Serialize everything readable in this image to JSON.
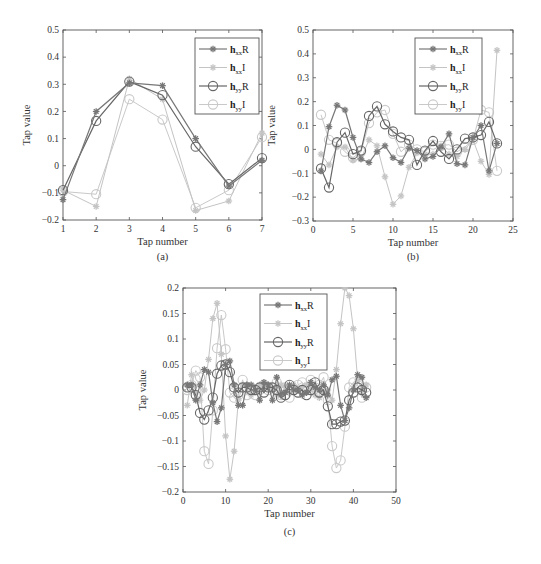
{
  "chart_data": [
    {
      "id": "a",
      "type": "line",
      "caption": "(a)",
      "xlabel": "Tap number",
      "ylabel": "Tap value",
      "xlim": [
        1,
        7
      ],
      "ylim": [
        -0.2,
        0.5
      ],
      "xticks": [
        1,
        2,
        3,
        4,
        5,
        6,
        7
      ],
      "yticks": [
        -0.2,
        -0.1,
        0,
        0.1,
        0.2,
        0.3,
        0.4,
        0.5
      ],
      "ytick_labels": [
        "−0.2",
        "−0.1",
        "0",
        "0.1",
        "0.2",
        "0.3",
        "0.4",
        "0.5"
      ],
      "grid": false,
      "legend_position": "top-right",
      "x": [
        1,
        2,
        3,
        4,
        5,
        6,
        7
      ],
      "series": [
        {
          "name": "hxxR",
          "values": [
            -0.125,
            0.2,
            0.305,
            0.295,
            0.1,
            -0.075,
            0.02
          ]
        },
        {
          "name": "hxxI",
          "values": [
            -0.09,
            -0.15,
            0.32,
            0.245,
            -0.165,
            -0.13,
            0.12
          ]
        },
        {
          "name": "hyyR",
          "values": [
            -0.09,
            0.165,
            0.31,
            0.26,
            0.07,
            -0.068,
            0.028
          ]
        },
        {
          "name": "hyyI",
          "values": [
            -0.095,
            -0.105,
            0.245,
            0.17,
            -0.155,
            -0.09,
            0.105
          ]
        }
      ]
    },
    {
      "id": "b",
      "type": "line",
      "caption": "(b)",
      "xlabel": "Tap number",
      "ylabel": "Tap value",
      "xlim": [
        0,
        25
      ],
      "ylim": [
        -0.3,
        0.5
      ],
      "xticks": [
        0,
        5,
        10,
        15,
        20,
        25
      ],
      "yticks": [
        -0.3,
        -0.2,
        -0.1,
        0,
        0.1,
        0.2,
        0.3,
        0.4,
        0.5
      ],
      "ytick_labels": [
        "−0.3",
        "−0.2",
        "−0.1",
        "0",
        "0.1",
        "0.2",
        "0.3",
        "0.4",
        "0.5"
      ],
      "grid": false,
      "legend_position": "top-right",
      "x": [
        1,
        2,
        3,
        4,
        5,
        6,
        7,
        8,
        9,
        10,
        11,
        12,
        13,
        14,
        15,
        16,
        17,
        18,
        19,
        20,
        21,
        22,
        23
      ],
      "series": [
        {
          "name": "hxxR",
          "values": [
            -0.09,
            0.095,
            0.185,
            0.165,
            0.05,
            -0.04,
            -0.055,
            -0.01,
            0.015,
            -0.035,
            -0.055,
            0.005,
            -0.005,
            -0.04,
            -0.03,
            0.01,
            0.065,
            -0.06,
            -0.065,
            0.05,
            0.1,
            -0.09,
            0.025
          ]
        },
        {
          "name": "hxxI",
          "values": [
            -0.02,
            -0.065,
            0.01,
            0.01,
            -0.045,
            -0.04,
            0.04,
            0.015,
            -0.115,
            -0.23,
            -0.195,
            -0.075,
            -0.015,
            -0.02,
            -0.02,
            0.015,
            -0.02,
            -0.03,
            0.0,
            0.04,
            -0.05,
            -0.105,
            0.415
          ]
        },
        {
          "name": "hyyR",
          "values": [
            -0.08,
            -0.16,
            0.03,
            0.07,
            -0.02,
            -0.005,
            0.14,
            0.18,
            0.105,
            0.075,
            0.05,
            0.04,
            -0.065,
            -0.005,
            0.035,
            -0.01,
            -0.04,
            0.0,
            0.045,
            0.05,
            0.06,
            0.115,
            0.025
          ]
        },
        {
          "name": "hyyI",
          "values": [
            0.145,
            0.04,
            0.025,
            -0.01,
            -0.035,
            -0.01,
            0.11,
            0.155,
            0.165,
            0.065,
            -0.01,
            0.02,
            0.0,
            -0.01,
            0.02,
            0.015,
            0.02,
            -0.01,
            0.01,
            0.04,
            0.165,
            0.155,
            -0.09
          ]
        }
      ]
    },
    {
      "id": "c",
      "type": "line",
      "caption": "(c)",
      "xlabel": "Tap number",
      "ylabel": "Tap value",
      "xlim": [
        0,
        50
      ],
      "ylim": [
        -0.2,
        0.2
      ],
      "xticks": [
        0,
        10,
        20,
        30,
        40,
        50
      ],
      "yticks": [
        -0.2,
        -0.15,
        -0.1,
        -0.05,
        0,
        0.05,
        0.1,
        0.15,
        0.2
      ],
      "ytick_labels": [
        "−0.2",
        "−0.15",
        "−0.1",
        "−0.05",
        "0",
        "0.05",
        "0.1",
        "0.15",
        "0.2"
      ],
      "grid": false,
      "legend_position": "top-center",
      "x": [
        1,
        2,
        3,
        4,
        5,
        6,
        7,
        8,
        9,
        10,
        11,
        12,
        13,
        14,
        15,
        16,
        17,
        18,
        19,
        20,
        21,
        22,
        23,
        24,
        25,
        26,
        27,
        28,
        29,
        30,
        31,
        32,
        33,
        34,
        35,
        36,
        37,
        38,
        39,
        40,
        41,
        42,
        43
      ],
      "series": [
        {
          "name": "hxxR",
          "values": [
            0.01,
            0.01,
            -0.02,
            0.01,
            0.04,
            0.035,
            -0.025,
            -0.062,
            -0.035,
            0.05,
            0.057,
            0.01,
            -0.03,
            -0.03,
            0.01,
            0.01,
            0.0,
            -0.02,
            0.015,
            0.01,
            -0.02,
            0.025,
            -0.01,
            -0.005,
            0.01,
            0.0,
            0.0,
            -0.01,
            -0.005,
            0.015,
            0.005,
            0.0,
            0.01,
            -0.01,
            0.02,
            0.027,
            -0.03,
            -0.06,
            -0.035,
            0.0,
            0.03,
            0.025,
            -0.015
          ]
        },
        {
          "name": "hxxI",
          "values": [
            -0.03,
            0.03,
            -0.005,
            -0.02,
            0.0,
            0.06,
            0.14,
            0.17,
            0.07,
            -0.09,
            -0.175,
            -0.12,
            -0.02,
            0.01,
            0.01,
            -0.01,
            0.0,
            0.01,
            0.005,
            0.01,
            0.0,
            -0.01,
            0.01,
            0.005,
            -0.005,
            0.01,
            0.0,
            0.005,
            0.01,
            0.0,
            -0.01,
            -0.015,
            -0.005,
            0.0,
            -0.02,
            0.04,
            0.13,
            0.2,
            0.185,
            0.12,
            0.02,
            0.0,
            0.01
          ]
        },
        {
          "name": "hyyR",
          "values": [
            0.005,
            0.005,
            -0.01,
            -0.045,
            -0.058,
            -0.04,
            -0.015,
            0.032,
            0.048,
            0.05,
            0.035,
            0.005,
            -0.005,
            0.005,
            0.005,
            0.0,
            0.0,
            0.005,
            -0.005,
            0.005,
            0.005,
            0.0,
            -0.015,
            -0.01,
            0.01,
            0.0,
            -0.005,
            0.0,
            -0.01,
            0.0,
            0.015,
            -0.005,
            0.0,
            -0.032,
            -0.067,
            -0.067,
            -0.062,
            -0.06,
            -0.02,
            -0.005,
            0.005,
            0.0,
            -0.005
          ]
        },
        {
          "name": "hyyI",
          "values": [
            0.0,
            0.01,
            0.038,
            0.025,
            -0.12,
            -0.145,
            -0.04,
            0.082,
            0.147,
            0.08,
            -0.005,
            -0.015,
            -0.01,
            0.02,
            -0.01,
            0.005,
            -0.01,
            0.0,
            0.01,
            0.0,
            0.005,
            0.015,
            -0.01,
            0.005,
            -0.015,
            0.0,
            0.01,
            0.015,
            0.005,
            0.02,
            0.005,
            0.01,
            0.025,
            -0.02,
            -0.11,
            -0.153,
            -0.138,
            -0.072,
            0.005,
            0.015,
            0.01,
            -0.015,
            0.005
          ]
        }
      ]
    }
  ],
  "legend": [
    {
      "base": "h",
      "sub": "xx",
      "suffix": "R",
      "marker": "star",
      "color": "#777777"
    },
    {
      "base": "h",
      "sub": "xx",
      "suffix": "I",
      "marker": "star",
      "color": "#c4c4c4"
    },
    {
      "base": "h",
      "sub": "yy",
      "suffix": "R",
      "marker": "circle",
      "color": "#666666"
    },
    {
      "base": "h",
      "sub": "yy",
      "suffix": "I",
      "marker": "circle",
      "color": "#c9c9c9"
    }
  ]
}
